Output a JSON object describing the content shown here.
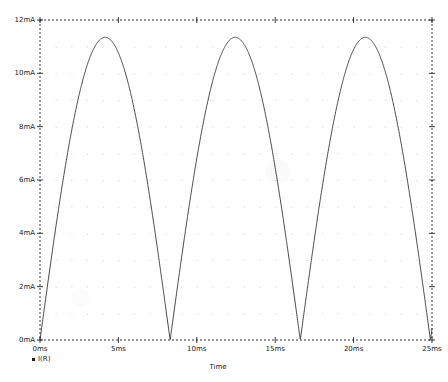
{
  "chart_data": {
    "type": "line",
    "title": "",
    "subtitle": "",
    "xlabel": "Time",
    "ylabel": "",
    "xlim": [
      0,
      25
    ],
    "ylim": [
      0,
      12
    ],
    "x_unit": "ms",
    "y_unit": "mA",
    "grid": true,
    "grid_style": "dotted",
    "legend_position": "bottom-left",
    "x_tick_labels": [
      "0ms",
      "5ms",
      "10ms",
      "15ms",
      "20ms",
      "25ms"
    ],
    "x_tick_values": [
      0,
      5,
      10,
      15,
      20,
      25
    ],
    "y_tick_labels": [
      "0mA",
      "2mA",
      "4mA",
      "6mA",
      "8mA",
      "10mA",
      "12mA"
    ],
    "y_tick_values": [
      0,
      2,
      4,
      6,
      8,
      10,
      12
    ],
    "series": [
      {
        "name": "I(R)",
        "color": "#333333",
        "marker": "square",
        "description": "full-wave rectified sine current",
        "amplitude_mA": 11.35,
        "period_ms": 8.3,
        "phase_ms": 0,
        "points_x": [
          0.0,
          0.25,
          0.5,
          0.75,
          1.0,
          1.25,
          1.5,
          1.75,
          2.0,
          2.25,
          2.5,
          2.75,
          3.0,
          3.25,
          3.5,
          3.75,
          4.0,
          4.15,
          4.3,
          4.55,
          4.8,
          5.05,
          5.3,
          5.55,
          5.8,
          6.05,
          6.3,
          6.55,
          6.8,
          7.05,
          7.3,
          7.55,
          7.8,
          8.05,
          8.3,
          8.55,
          8.8,
          9.05,
          9.3,
          9.55,
          9.8,
          10.05,
          10.3,
          10.55,
          10.8,
          11.05,
          11.3,
          11.55,
          11.8,
          12.05,
          12.3,
          12.45,
          12.6,
          12.85,
          13.1,
          13.35,
          13.6,
          13.85,
          14.1,
          14.35,
          14.6,
          14.85,
          15.1,
          15.35,
          15.6,
          15.85,
          16.1,
          16.35,
          16.6,
          16.6,
          16.85,
          17.1,
          17.35,
          17.6,
          17.85,
          18.1,
          18.35,
          18.6,
          18.85,
          19.1,
          19.35,
          19.6,
          19.85,
          20.1,
          20.35,
          20.6,
          20.75,
          20.9,
          21.15,
          21.4,
          21.65,
          21.9,
          22.15,
          22.4,
          22.65,
          22.9,
          23.15,
          23.4,
          23.65,
          23.9,
          24.15,
          24.4,
          24.65,
          24.9,
          25.0
        ],
        "points_y": [
          0.0,
          1.07,
          2.12,
          3.14,
          4.11,
          5.02,
          5.85,
          6.6,
          7.25,
          7.8,
          8.24,
          8.56,
          8.76,
          8.84,
          8.8,
          8.64,
          8.36,
          8.1,
          7.79,
          7.1,
          6.3,
          5.41,
          4.46,
          3.46,
          2.43,
          1.4,
          0.38,
          0.62,
          1.62,
          2.62,
          3.6,
          4.55,
          5.44,
          6.27,
          7.02,
          7.68,
          8.23,
          8.65,
          8.94,
          9.09,
          9.1,
          8.96,
          8.68,
          8.27,
          7.72,
          7.05,
          6.27,
          5.4,
          4.45,
          3.44,
          2.4,
          1.86,
          1.33,
          0.3,
          0.72,
          1.73,
          2.72,
          3.7,
          4.64,
          5.52,
          6.34,
          7.07,
          7.71,
          8.24,
          8.66,
          8.95,
          9.1,
          9.11,
          8.98,
          8.98,
          8.71,
          8.31,
          7.77,
          7.11,
          6.34,
          5.48,
          4.55,
          3.55,
          2.52,
          1.48,
          0.45,
          0.57,
          1.6,
          2.61,
          3.59,
          4.54,
          5.06,
          5.56,
          6.46,
          7.23,
          7.88,
          8.4,
          8.77,
          9.0,
          9.08,
          9.01,
          8.79,
          8.43,
          7.93,
          7.31,
          6.57,
          5.73,
          5.29
        ]
      }
    ],
    "peaks": [
      {
        "x_ms": 3.9,
        "y_mA": 11.35
      },
      {
        "x_ms": 12.2,
        "y_mA": 11.3
      },
      {
        "x_ms": 20.5,
        "y_mA": 11.25
      }
    ],
    "zeros": [
      {
        "x_ms": 0.0,
        "y_mA": 0.0
      },
      {
        "x_ms": 8.05,
        "y_mA": 0.0
      },
      {
        "x_ms": 16.4,
        "y_mA": 0.0
      }
    ]
  },
  "legend": {
    "entries": [
      {
        "marker": "square-marker",
        "label": "I(R)"
      }
    ]
  },
  "axes": {
    "x_axis_title": "Time",
    "y_axis_title": ""
  },
  "colors": {
    "trace": "#333333",
    "axis": "#202020",
    "grid": "#b8b8b8",
    "background": "#ffffff"
  }
}
